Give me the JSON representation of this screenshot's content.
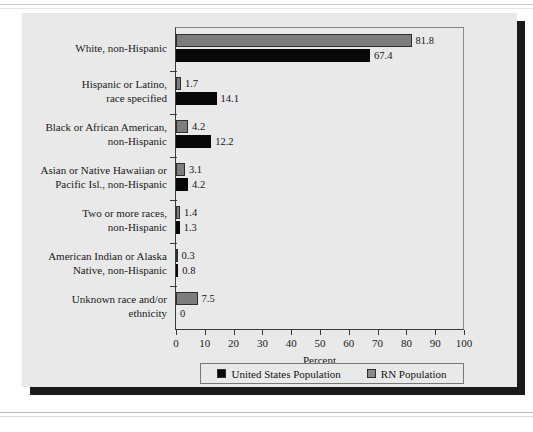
{
  "chart_data": {
    "type": "bar",
    "orientation": "horizontal",
    "title": "",
    "xlabel": "Percent",
    "ylabel": "",
    "xlim": [
      0,
      100
    ],
    "xticks": [
      0,
      10,
      20,
      30,
      40,
      50,
      60,
      70,
      80,
      90,
      100
    ],
    "grid": false,
    "legend_position": "bottom",
    "categories": [
      "White, non-Hispanic",
      "Hispanic or Latino,\nrace specified",
      "Black or African American,\nnon-Hispanic",
      "Asian or Native Hawaiian or\nPacific Isl., non-Hispanic",
      "Two or more races,\nnon-Hispanic",
      "American Indian or Alaska\nNative, non-Hispanic",
      "Unknown race and/or\nethnicity"
    ],
    "series": [
      {
        "name": "RN Population",
        "color": "#7d7d7d",
        "values": [
          81.8,
          1.7,
          4.2,
          3.1,
          1.4,
          0.3,
          7.5
        ],
        "labels": [
          "81.8",
          "1.7",
          "4.2",
          "3.1",
          "1.4",
          "0.3",
          "7.5"
        ]
      },
      {
        "name": "United States Population",
        "color": "#080808",
        "values": [
          67.4,
          14.1,
          12.2,
          4.2,
          1.3,
          0.8,
          0
        ],
        "labels": [
          "67.4",
          "14.1",
          "12.2",
          "4.2",
          "1.3",
          "0.8",
          "0"
        ]
      }
    ]
  },
  "legend": {
    "items": [
      {
        "label": "United States Population",
        "swatch": "us"
      },
      {
        "label": "RN Population",
        "swatch": "rn"
      }
    ]
  },
  "axis": {
    "x_title": "Percent",
    "tick_labels": [
      "0",
      "10",
      "20",
      "30",
      "40",
      "50",
      "60",
      "70",
      "80",
      "90",
      "100"
    ]
  }
}
